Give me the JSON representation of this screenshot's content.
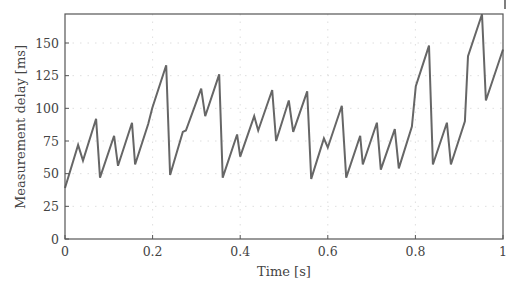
{
  "chart_data": {
    "type": "line",
    "title": "",
    "xlabel": "Time [s]",
    "ylabel": "Measurement delay [ms]",
    "xlim": [
      0,
      1
    ],
    "ylim": [
      0,
      172
    ],
    "xticks": [
      0,
      0.2,
      0.4,
      0.6,
      0.8,
      1
    ],
    "xtick_labels": [
      "0",
      "0.2",
      "0.4",
      "0.6",
      "0.8",
      "1"
    ],
    "yticks": [
      0,
      25,
      50,
      75,
      100,
      125,
      150
    ],
    "ytick_labels": [
      "0",
      "25",
      "50",
      "75",
      "100",
      "125",
      "150"
    ],
    "grid": true,
    "legend": null,
    "series": [
      {
        "name": "Measurement delay",
        "color": "#666666",
        "x": [
          0,
          0.03,
          0.041,
          0.071,
          0.08,
          0.112,
          0.121,
          0.153,
          0.16,
          0.19,
          0.199,
          0.231,
          0.24,
          0.269,
          0.276,
          0.311,
          0.32,
          0.352,
          0.36,
          0.393,
          0.4,
          0.432,
          0.441,
          0.473,
          0.482,
          0.511,
          0.521,
          0.553,
          0.562,
          0.591,
          0.6,
          0.632,
          0.642,
          0.674,
          0.68,
          0.712,
          0.721,
          0.753,
          0.762,
          0.792,
          0.801,
          0.831,
          0.84,
          0.872,
          0.881,
          0.913,
          0.92,
          0.952,
          0.961,
          1.0
        ],
        "y": [
          39,
          72,
          60,
          92,
          47,
          79,
          56,
          89,
          57,
          88,
          100,
          133,
          49,
          82,
          83,
          115,
          94,
          126,
          47,
          80,
          63,
          94,
          83,
          114,
          75,
          106,
          82,
          113,
          46,
          77,
          70,
          102,
          47,
          79,
          57,
          89,
          53,
          84,
          54,
          86,
          117,
          148,
          57,
          89,
          57,
          90,
          140,
          172,
          106,
          145
        ]
      }
    ]
  }
}
